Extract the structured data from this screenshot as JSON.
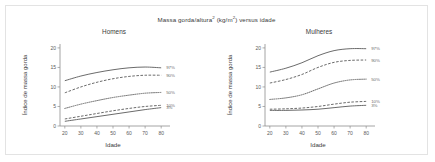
{
  "figure": {
    "title_main": "Massa gorda/altura",
    "title_sup1": "2",
    "title_mid": " (kg/m",
    "title_sup2": "2",
    "title_end": ") versus idade"
  },
  "chart_data": [
    {
      "type": "line",
      "title": "Homens",
      "xlabel": "Idade",
      "ylabel": "Índice de massa gorda",
      "xlim": [
        17,
        83
      ],
      "ylim": [
        0,
        21
      ],
      "xticks": [
        20,
        30,
        40,
        50,
        60,
        70,
        80
      ],
      "yticks": [
        0,
        5,
        10,
        15,
        20
      ],
      "grid": false,
      "legend_position": "right-inline",
      "x": [
        20,
        30,
        40,
        50,
        60,
        70,
        80
      ],
      "series": [
        {
          "name": "97%",
          "style": "solid",
          "values": [
            11.6,
            12.8,
            13.7,
            14.4,
            14.9,
            15.1,
            14.9
          ]
        },
        {
          "name": "90%",
          "style": "dashed",
          "values": [
            8.5,
            10.0,
            11.2,
            12.1,
            12.7,
            13.0,
            13.0
          ]
        },
        {
          "name": "50%",
          "style": "dotted",
          "values": [
            4.5,
            5.6,
            6.5,
            7.3,
            7.9,
            8.4,
            8.6
          ]
        },
        {
          "name": "10%",
          "style": "dashed",
          "values": [
            1.8,
            2.5,
            3.2,
            3.9,
            4.5,
            5.0,
            5.3
          ]
        },
        {
          "name": "3%",
          "style": "solid",
          "values": [
            1.2,
            1.8,
            2.4,
            3.0,
            3.6,
            4.2,
            4.7
          ]
        }
      ]
    },
    {
      "type": "line",
      "title": "Mulheres",
      "xlabel": "Idade",
      "ylabel": "Índice de massa gorda",
      "xlim": [
        17,
        83
      ],
      "ylim": [
        0,
        21
      ],
      "xticks": [
        20,
        30,
        40,
        50,
        60,
        70,
        80
      ],
      "yticks": [
        0,
        5,
        10,
        15,
        20
      ],
      "grid": false,
      "legend_position": "right-inline",
      "x": [
        20,
        30,
        40,
        50,
        60,
        70,
        80
      ],
      "series": [
        {
          "name": "97%",
          "style": "solid",
          "values": [
            13.8,
            14.8,
            16.2,
            18.0,
            19.3,
            19.8,
            19.8
          ]
        },
        {
          "name": "90%",
          "style": "dashed",
          "values": [
            11.0,
            11.9,
            13.2,
            15.0,
            16.3,
            16.8,
            16.9
          ]
        },
        {
          "name": "50%",
          "style": "dotted",
          "values": [
            6.8,
            7.2,
            8.0,
            9.5,
            11.0,
            11.8,
            12.0
          ]
        },
        {
          "name": "10%",
          "style": "dashed",
          "values": [
            4.3,
            4.4,
            4.6,
            5.0,
            5.6,
            6.1,
            6.3
          ]
        },
        {
          "name": "3%",
          "style": "solid",
          "values": [
            4.0,
            4.0,
            4.1,
            4.3,
            4.7,
            5.1,
            5.3
          ]
        }
      ]
    }
  ]
}
